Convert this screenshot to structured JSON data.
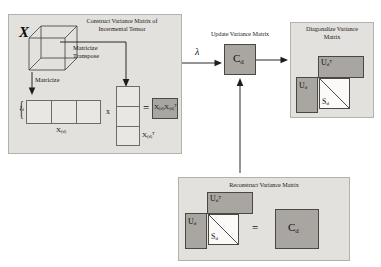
{
  "diagram": {
    "panels": {
      "construct": {
        "title_line1": "Construct Variance Matrix of",
        "title_line2": "Incermental Tensor",
        "tensor_label": "X",
        "matricize_label": "Matricize",
        "matricize_transpose_line1": "Matricize",
        "matricize_transpose_line2": "Transpose",
        "row_index_label": "I",
        "row_index_sub": "d",
        "matrix_label": "X",
        "matrix_sub": "(d)",
        "matrix_t_label": "X",
        "matrix_t_sub": "(d)",
        "matrix_t_sup": "T",
        "times_symbol": "x",
        "equals_symbol": "=",
        "result_label": "X",
        "result_sub": "(d)",
        "result_label2": "X",
        "result_sub2": "(d)",
        "result_sup2": "T"
      },
      "update": {
        "title": "Update Variance Matrix",
        "lambda_label": "λ",
        "box_label": "C",
        "box_sub": "d"
      },
      "diagonalize": {
        "title_line1": "Diagonalize Variance",
        "title_line2": "Matrix",
        "ut_label": "U",
        "ut_sub": "d",
        "ut_sup": "T",
        "u_label": "U",
        "u_sub": "d",
        "s_label": "S",
        "s_sub": "d"
      },
      "reconstruct": {
        "title": "Reconstruct Variance Matrix",
        "ut_label": "U",
        "ut_sub": "d",
        "ut_sup": "T",
        "u_label": "U",
        "u_sub": "d",
        "s_label": "S",
        "s_sub": "d",
        "equals_symbol": "=",
        "c_label": "C",
        "c_sub": "d"
      }
    },
    "colors": {
      "panel_bg": "#e3e1dd",
      "panel_border": "#b4b1ac",
      "shaded_fill": "#a9a6a1",
      "shaded_border": "#4a4845",
      "hollow_fill": "#e9e7e3",
      "white_fill": "#fbfaf8",
      "arrow": "#2a2a2a",
      "text": "#111111"
    }
  }
}
